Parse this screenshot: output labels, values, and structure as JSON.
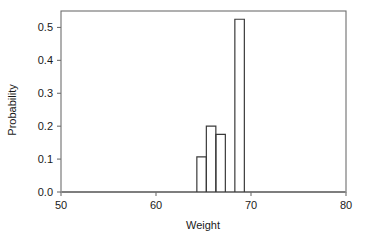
{
  "chart_data": {
    "type": "bar",
    "title": "",
    "subtitle": "",
    "xlabel": "Weight",
    "ylabel": "Probability",
    "xlim": [
      50,
      80
    ],
    "ylim": [
      0.0,
      0.55
    ],
    "grid": false,
    "legend": null,
    "x_ticks": [
      50,
      60,
      70,
      80
    ],
    "x_tick_labels": [
      "50",
      "60",
      "70",
      "80"
    ],
    "y_ticks": [
      0.0,
      0.1,
      0.2,
      0.3,
      0.4,
      0.5
    ],
    "y_tick_labels": [
      "0.0",
      "0.1",
      "0.2",
      "0.3",
      "0.4",
      "0.5"
    ],
    "bar_style": {
      "fill": "none",
      "edge_color": "#3a3a3a",
      "edge_width": 1.2
    },
    "baseline_y": 0.0,
    "bars": [
      {
        "x_start": 64.3,
        "x_end": 65.3,
        "value": 0.107
      },
      {
        "x_start": 65.3,
        "x_end": 66.3,
        "value": 0.2
      },
      {
        "x_start": 66.3,
        "x_end": 67.3,
        "value": 0.175
      },
      {
        "x_start": 67.3,
        "x_end": 68.3,
        "value": 0.0
      },
      {
        "x_start": 68.3,
        "x_end": 69.3,
        "value": 0.525
      }
    ],
    "categories": [
      "64.3-65.3",
      "65.3-66.3",
      "66.3-67.3",
      "67.3-68.3",
      "68.3-69.3"
    ],
    "values": [
      0.107,
      0.2,
      0.175,
      0.0,
      0.525
    ]
  },
  "colors": {
    "frame": "#6e6e6e",
    "bar_edge": "#3a3a3a",
    "baseline": "#6e6e6e",
    "text": "#1a1a1a",
    "background": "#ffffff"
  },
  "labels": {
    "x_axis_title": "Weight",
    "y_axis_title": "Probability"
  }
}
